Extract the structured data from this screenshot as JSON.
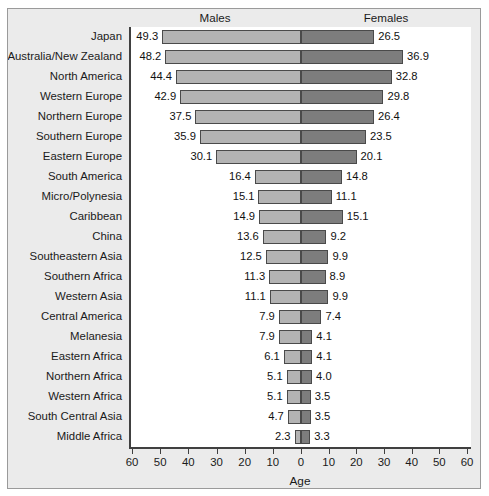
{
  "chart_data": {
    "type": "bar",
    "subtype": "bilateral-butterfly-bar",
    "title": "",
    "xlabel": "Age",
    "ylabel": "",
    "categories": [
      "Japan",
      "Australia/New Zealand",
      "North America",
      "Western Europe",
      "Northern Europe",
      "Southern Europe",
      "Eastern Europe",
      "South America",
      "Micro/Polynesia",
      "Caribbean",
      "China",
      "Southeastern Asia",
      "Southern Africa",
      "Western Asia",
      "Central America",
      "Melanesia",
      "Eastern Africa",
      "Northern Africa",
      "Western Africa",
      "South Central Asia",
      "Middle Africa"
    ],
    "series": [
      {
        "name": "Males",
        "direction": "left",
        "color": "#b3b3b3",
        "values": [
          49.3,
          48.2,
          44.4,
          42.9,
          37.5,
          35.9,
          30.1,
          16.4,
          15.1,
          14.9,
          13.6,
          12.5,
          11.3,
          11.1,
          7.9,
          7.9,
          6.1,
          5.1,
          5.1,
          4.7,
          2.3
        ]
      },
      {
        "name": "Females",
        "direction": "right",
        "color": "#7d7d7d",
        "values": [
          26.5,
          36.9,
          32.8,
          29.8,
          26.4,
          23.5,
          20.1,
          14.8,
          11.1,
          15.1,
          9.2,
          9.9,
          8.9,
          9.9,
          7.4,
          4.1,
          4.1,
          4.0,
          3.5,
          3.5,
          3.3
        ]
      }
    ],
    "xlim": [
      -60,
      60
    ],
    "xticks": [
      60,
      50,
      40,
      30,
      20,
      10,
      0,
      10,
      20,
      30,
      40,
      50,
      60
    ],
    "grid": false,
    "legend": "column-headers"
  },
  "headers": {
    "males": "Males",
    "females": "Females"
  },
  "axis": {
    "title": "Age",
    "tick_labels": [
      "60",
      "50",
      "40",
      "30",
      "20",
      "10",
      "0",
      "10",
      "20",
      "30",
      "40",
      "50",
      "60"
    ]
  },
  "colors": {
    "male_bar": "#b3b3b3",
    "female_bar": "#7d7d7d",
    "bar_outline": "#4a4a4a",
    "figure_background": "#ebebeb",
    "plot_background": "#ffffff",
    "axis_line": "#404040",
    "text": "#1a1a1a"
  }
}
